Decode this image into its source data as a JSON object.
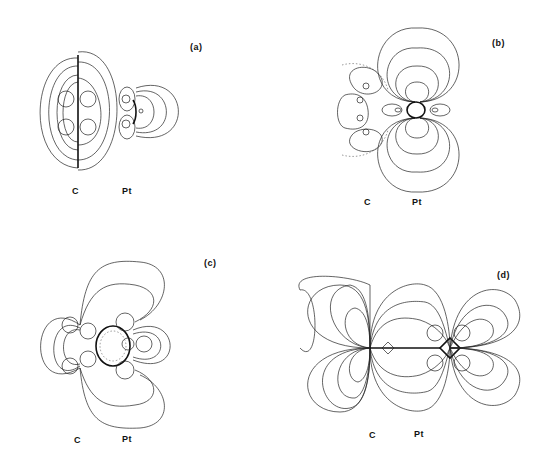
{
  "figure": {
    "panels": [
      {
        "id": "a",
        "label": "(a)",
        "atoms": [
          "C",
          "Pt"
        ]
      },
      {
        "id": "b",
        "label": "(b)",
        "atoms": [
          "C",
          "Pt"
        ]
      },
      {
        "id": "c",
        "label": "(c)",
        "atoms": [
          "C",
          "Pt"
        ]
      },
      {
        "id": "d",
        "label": "(d)",
        "atoms": [
          "C",
          "Pt"
        ]
      }
    ]
  }
}
